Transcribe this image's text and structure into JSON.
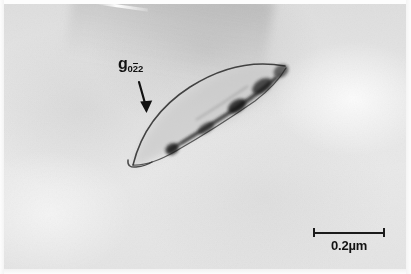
{
  "figure": {
    "kind": "tem-micrograph",
    "width": 411,
    "height": 274,
    "background_color": "#e6e6e6",
    "ink_color": "#111111"
  },
  "annotations": {
    "g_vector": {
      "symbol": "g",
      "subscript_prefix": "0",
      "subscript_barred": "2",
      "subscript_suffix": "2",
      "full_text": "g022",
      "arrow": {
        "name": "g-vector-arrow",
        "from_x": 139,
        "from_y": 82,
        "to_x": 146,
        "to_y": 112
      }
    },
    "scale_bar": {
      "label": "0.2µm",
      "length_px": 70,
      "value": "0.2",
      "unit": "µm"
    }
  },
  "features": {
    "precipitate": {
      "name": "lenticular-precipitate",
      "description": "elongated lens-shaped precipitate with dark interfacial contrast",
      "tip_left_x": 131,
      "tip_left_y": 166,
      "tip_right_x": 287,
      "tip_right_y": 67
    },
    "bend_contour": {
      "name": "bend-contour-band",
      "description": "broad diagonal diffraction contour across upper field"
    },
    "scratch": {
      "name": "emulsion-scratch",
      "description": "bright diagonal scratch near top edge"
    }
  }
}
